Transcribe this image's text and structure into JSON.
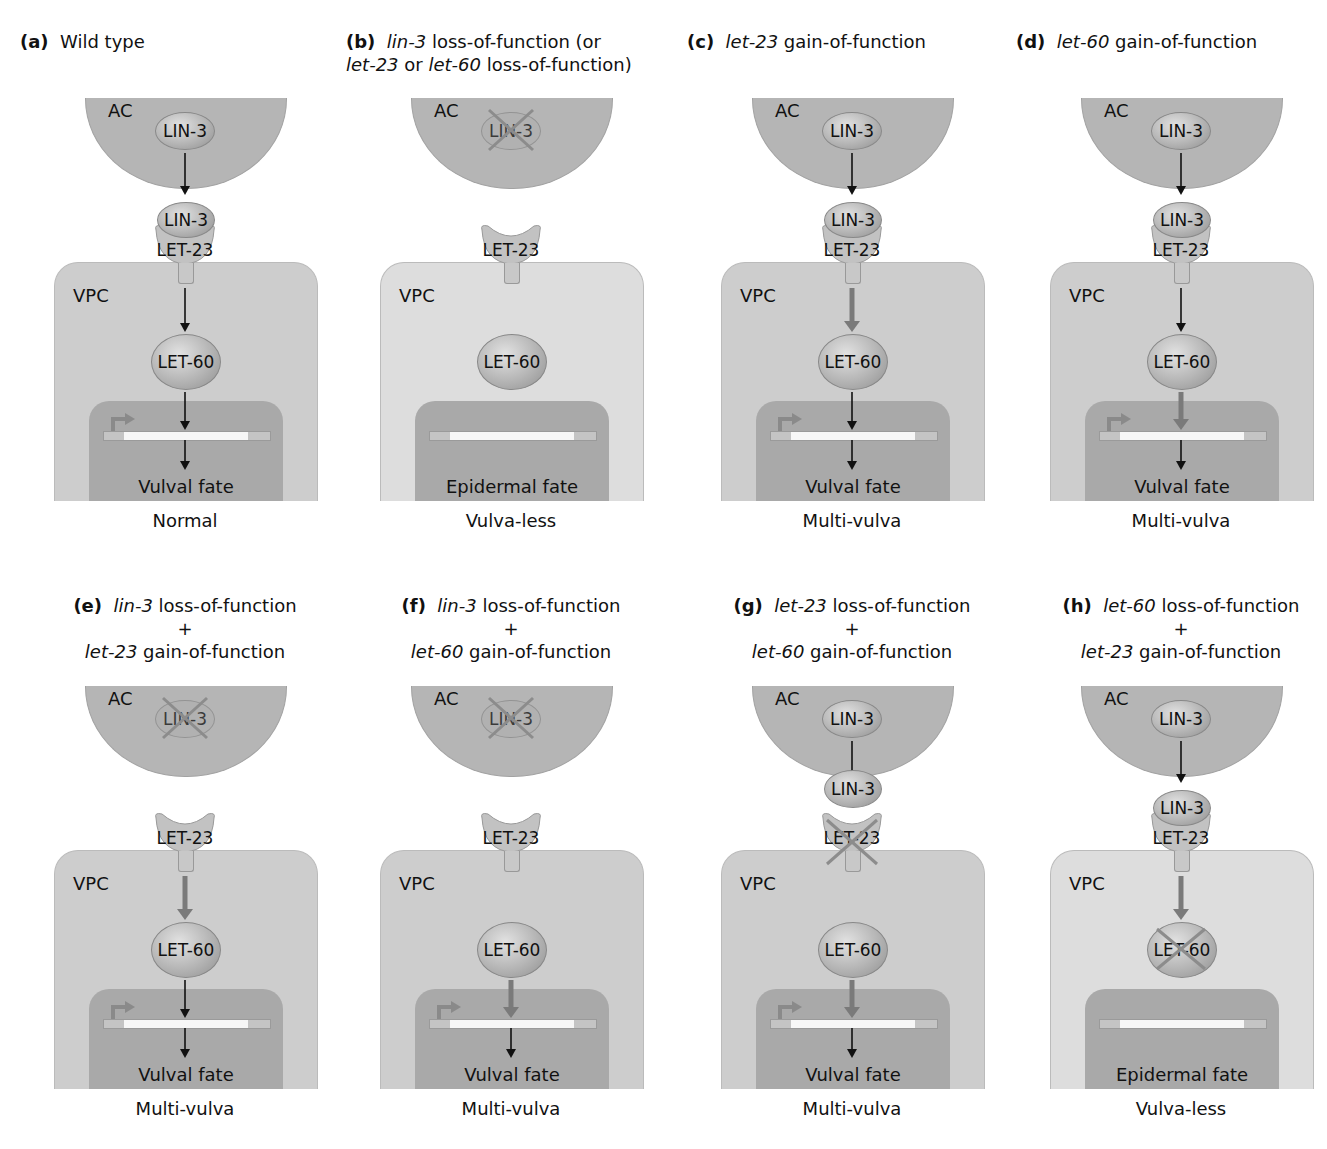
{
  "figure": {
    "panels": [
      {
        "id": "a",
        "label": "(a)",
        "title_lines": [
          [
            {
              "t": "Wild type",
              "i": false
            }
          ]
        ],
        "lin3_knocked": false,
        "let23_knocked": false,
        "let60_knocked": false,
        "lin3_bound": true,
        "arrow_ac": "thin",
        "arrow_receptor": "thin",
        "arrow_let60": "thin",
        "gene_active": true,
        "vpc_light": false,
        "fate": "Vulval fate",
        "phenotype": "Normal"
      },
      {
        "id": "b",
        "label": "(b)",
        "title_lines": [
          [
            {
              "t": "lin-3",
              "i": true
            },
            {
              "t": " loss-of-function (or",
              "i": false
            }
          ],
          [
            {
              "t": "let-23",
              "i": true
            },
            {
              "t": " or ",
              "i": false
            },
            {
              "t": "let-60",
              "i": true
            },
            {
              "t": " loss-of-function)",
              "i": false
            }
          ]
        ],
        "lin3_knocked": true,
        "let23_knocked": false,
        "let60_knocked": false,
        "lin3_bound": false,
        "arrow_ac": "none",
        "arrow_receptor": "none",
        "arrow_let60": "none",
        "gene_active": false,
        "vpc_light": true,
        "fate": "Epidermal fate",
        "phenotype": "Vulva-less"
      },
      {
        "id": "c",
        "label": "(c)",
        "title_lines": [
          [
            {
              "t": "let-23",
              "i": true
            },
            {
              "t": " gain-of-function",
              "i": false
            }
          ]
        ],
        "lin3_knocked": false,
        "let23_knocked": false,
        "let60_knocked": false,
        "lin3_bound": true,
        "arrow_ac": "thin",
        "arrow_receptor": "thick",
        "arrow_let60": "thin",
        "gene_active": true,
        "vpc_light": false,
        "fate": "Vulval fate",
        "phenotype": "Multi-vulva"
      },
      {
        "id": "d",
        "label": "(d)",
        "title_lines": [
          [
            {
              "t": "let-60",
              "i": true
            },
            {
              "t": " gain-of-function",
              "i": false
            }
          ]
        ],
        "lin3_knocked": false,
        "let23_knocked": false,
        "let60_knocked": false,
        "lin3_bound": true,
        "arrow_ac": "thin",
        "arrow_receptor": "thin",
        "arrow_let60": "thick",
        "gene_active": true,
        "vpc_light": false,
        "fate": "Vulval fate",
        "phenotype": "Multi-vulva"
      },
      {
        "id": "e",
        "label": "(e)",
        "title_lines": [
          [
            {
              "t": "lin-3",
              "i": true
            },
            {
              "t": " loss-of-function",
              "i": false
            }
          ],
          [
            {
              "t": "+",
              "i": false
            }
          ],
          [
            {
              "t": "let-23",
              "i": true
            },
            {
              "t": " gain-of-function",
              "i": false
            }
          ]
        ],
        "lin3_knocked": true,
        "let23_knocked": false,
        "let60_knocked": false,
        "lin3_bound": false,
        "arrow_ac": "none",
        "arrow_receptor": "thick",
        "arrow_let60": "thin",
        "gene_active": true,
        "vpc_light": false,
        "fate": "Vulval fate",
        "phenotype": "Multi-vulva"
      },
      {
        "id": "f",
        "label": "(f)",
        "title_lines": [
          [
            {
              "t": "lin-3",
              "i": true
            },
            {
              "t": " loss-of-function",
              "i": false
            }
          ],
          [
            {
              "t": "+",
              "i": false
            }
          ],
          [
            {
              "t": "let-60",
              "i": true
            },
            {
              "t": " gain-of-function",
              "i": false
            }
          ]
        ],
        "lin3_knocked": true,
        "let23_knocked": false,
        "let60_knocked": false,
        "lin3_bound": false,
        "arrow_ac": "none",
        "arrow_receptor": "none",
        "arrow_let60": "thick",
        "gene_active": true,
        "vpc_light": false,
        "fate": "Vulval fate",
        "phenotype": "Multi-vulva"
      },
      {
        "id": "g",
        "label": "(g)",
        "title_lines": [
          [
            {
              "t": "let-23",
              "i": true
            },
            {
              "t": " loss-of-function",
              "i": false
            }
          ],
          [
            {
              "t": "+",
              "i": false
            }
          ],
          [
            {
              "t": "let-60",
              "i": true
            },
            {
              "t": " gain-of-function",
              "i": false
            }
          ]
        ],
        "lin3_knocked": false,
        "let23_knocked": true,
        "let60_knocked": false,
        "lin3_bound": "near",
        "arrow_ac": "thin",
        "arrow_receptor": "none",
        "arrow_let60": "thick",
        "gene_active": true,
        "vpc_light": false,
        "fate": "Vulval fate",
        "phenotype": "Multi-vulva"
      },
      {
        "id": "h",
        "label": "(h)",
        "title_lines": [
          [
            {
              "t": "let-60",
              "i": true
            },
            {
              "t": " loss-of-function",
              "i": false
            }
          ],
          [
            {
              "t": "+",
              "i": false
            }
          ],
          [
            {
              "t": "let-23",
              "i": true
            },
            {
              "t": " gain-of-function",
              "i": false
            }
          ]
        ],
        "lin3_knocked": false,
        "let23_knocked": false,
        "let60_knocked": true,
        "lin3_bound": true,
        "arrow_ac": "thin",
        "arrow_receptor": "thick",
        "arrow_let60": "none",
        "gene_active": false,
        "vpc_light": true,
        "fate": "Epidermal fate",
        "phenotype": "Vulva-less"
      }
    ],
    "labels": {
      "ac": "AC",
      "vpc": "VPC",
      "lin3": "LIN-3",
      "let23": "LET-23",
      "let60": "LET-60"
    },
    "colors": {
      "ac_fill": "#b5b5b5",
      "vpc_fill": "#cdcdcd",
      "vpc_light_fill": "#dddddd",
      "nucleus_fill": "#a9a9a9",
      "thick_arrow": "#7a7a7a",
      "knockout_x": "#8c8c8c"
    }
  }
}
